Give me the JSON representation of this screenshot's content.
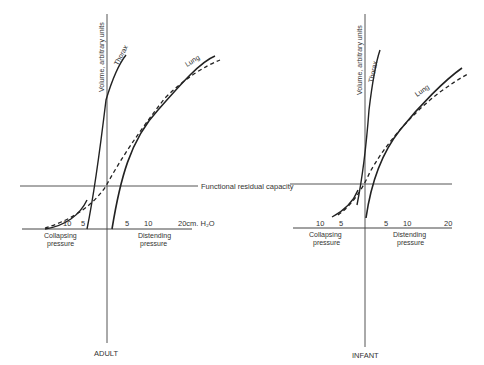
{
  "frc_label": "Functional residual capacity",
  "adult": {
    "title": "ADULT",
    "y_axis_label": "Volume, arbitrary units",
    "thorax_label": "Thorax",
    "lung_label": "Lung",
    "collapsing_label_1": "Collapsing",
    "collapsing_label_2": "pressure",
    "distending_label_1": "Distending",
    "distending_label_2": "pressure",
    "ticks_left": [
      "10",
      "5"
    ],
    "ticks_right": [
      "5",
      "10"
    ],
    "tick_end": "20cm. H₂O"
  },
  "infant": {
    "title": "INFANT",
    "y_axis_label": "Volume, arbitrary units",
    "thorax_label": "Thorax",
    "lung_label": "Lung",
    "collapsing_label_1": "Collapsing",
    "collapsing_label_2": "pressure",
    "distending_label_1": "Distending",
    "distending_label_2": "pressure",
    "ticks_left": [
      "10",
      "5"
    ],
    "ticks_right": [
      "5",
      "10"
    ],
    "tick_end": "20"
  }
}
